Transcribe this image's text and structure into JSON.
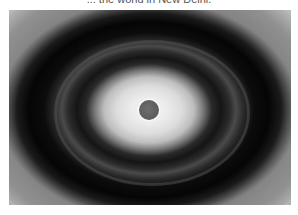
{
  "caption": {
    "text": "... the world in New Delhi."
  },
  "image": {
    "subject": "x-ray-diffraction-pattern",
    "description": "Concentric elliptical rings, bright halo around a dark central beam-stop spot, alternating dark and gray bands toward edges",
    "colors": {
      "center_spot": "#5c5c5c",
      "halo": "#f2f2f2",
      "dark_ring": "#050505",
      "gray_band": "#4a4a4a",
      "edge": "#9a9a9a"
    }
  }
}
